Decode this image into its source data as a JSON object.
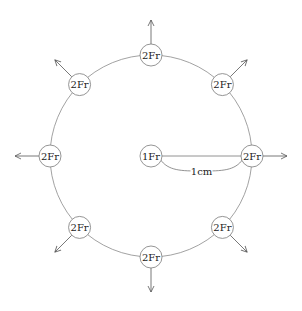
{
  "diagram": {
    "type": "force-diagram",
    "center": {
      "x": 151,
      "y": 156
    },
    "ring_radius": 101,
    "node_radius": 11,
    "arrow_length": 24,
    "center_node": {
      "label": "1Fr"
    },
    "outer_nodes": [
      {
        "id": "right",
        "angle": 0,
        "label": "2Fr"
      },
      {
        "id": "upper-right",
        "angle": 45,
        "label": "2Fr"
      },
      {
        "id": "top",
        "angle": 90,
        "label": "2Fr"
      },
      {
        "id": "upper-left",
        "angle": 135,
        "label": "2Fr"
      },
      {
        "id": "left",
        "angle": 180,
        "label": "2Fr"
      },
      {
        "id": "lower-left",
        "angle": 225,
        "label": "2Fr"
      },
      {
        "id": "bottom",
        "angle": 270,
        "label": "2Fr"
      },
      {
        "id": "lower-right",
        "angle": 315,
        "label": "2Fr"
      }
    ],
    "distance_label": "1cm",
    "colors": {
      "stroke": "#7a7a7a",
      "arrow": "#555555",
      "text": "#222222",
      "background": "#ffffff"
    }
  }
}
